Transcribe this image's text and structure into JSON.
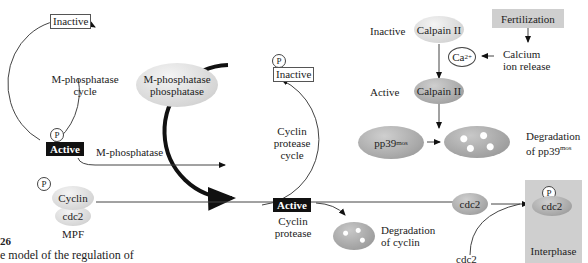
{
  "m_phosphatase_cycle": {
    "inactive_label": "Inactive",
    "cycle_label_line1": "M-phosphatase",
    "cycle_label_line2": "cycle",
    "active_label": "Active",
    "active_name": "M-phosphatase",
    "phospho_marker": "P"
  },
  "m_phosphatase_phosphatase": {
    "line1": "M-phosphatase",
    "line2": "phosphatase"
  },
  "mpf": {
    "phospho_marker": "P",
    "cyclin": "Cyclin",
    "cdc2": "cdc2",
    "label": "MPF"
  },
  "cyclin_protease_cycle": {
    "phospho_marker": "P",
    "inactive_label": "Inactive",
    "cycle_line1": "Cyclin",
    "cycle_line2": "protease",
    "cycle_line3": "cycle",
    "active_label": "Active",
    "active_name_line1": "Cyclin",
    "active_name_line2": "protease"
  },
  "calpain": {
    "inactive_state": "Inactive",
    "inactive_name": "Calpain II",
    "active_state": "Active",
    "active_name": "Calpain II",
    "calcium": "Ca",
    "calcium_charge": "2+"
  },
  "fertilization": {
    "label": "Fertilization",
    "release_line1": "Calcium",
    "release_line2": "ion release"
  },
  "pp39": {
    "name": "pp39",
    "sup": "mos",
    "degradation_line1": "Degradation",
    "degradation_line2": "of pp39",
    "degradation_sup": "mos"
  },
  "cyclin_degradation": {
    "line1": "Degradation",
    "line2": "of cyclin"
  },
  "cdc2_flow": {
    "free_cdc2": "cdc2",
    "lower_cdc2": "cdc2",
    "phospho_marker": "P",
    "interphase_cdc2": "cdc2",
    "interphase_label": "Interphase"
  },
  "caption": {
    "figure_number": "26",
    "text": "e model of the regulation of"
  }
}
